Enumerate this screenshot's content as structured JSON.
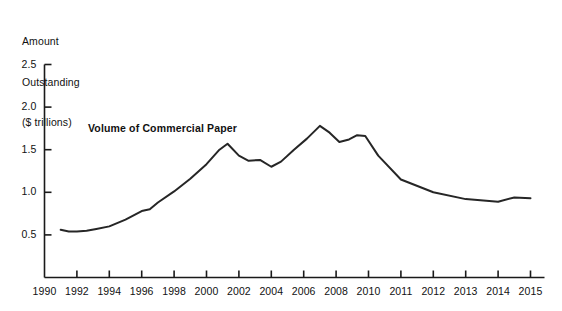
{
  "figure": {
    "background_color": "#ffffff",
    "axis_color": "#1a1a1a",
    "line_color": "#262626"
  },
  "axis_title": {
    "line1": "Amount",
    "line2": "Outstanding",
    "line3": "($ trillions)"
  },
  "annotation": {
    "text": "Volume of Commercial Paper",
    "x_px": 88,
    "y_px": 122
  },
  "chart_data": {
    "type": "line",
    "title": "",
    "subtitle": "",
    "xlabel": "",
    "ylabel": "Amount Outstanding ($ trillions)",
    "grid": false,
    "legend_position": "none",
    "annotations": [
      "Volume of Commercial Paper"
    ],
    "series_name": "Volume of Commercial Paper",
    "xlim": [
      1990,
      2015
    ],
    "ylim": [
      0,
      2.5
    ],
    "yticks": [
      0.5,
      1.0,
      1.5,
      2.0,
      2.5
    ],
    "ytick_labels": [
      "0.5",
      "1.0",
      "1.5",
      "2.0",
      "2.5"
    ],
    "xticks": [
      1990,
      1992,
      1994,
      1996,
      1998,
      2000,
      2002,
      2004,
      2006,
      2008,
      2010,
      2011,
      2012,
      2013,
      2014,
      2015
    ],
    "xtick_labels": [
      "1990",
      "1992",
      "1994",
      "1996",
      "1998",
      "2000",
      "2002",
      "2004",
      "2006",
      "2008",
      "2010",
      "2011",
      "2012",
      "2013",
      "2014",
      "2015"
    ],
    "x": [
      1991.0,
      1991.5,
      1992.0,
      1992.6,
      1993.2,
      1994.0,
      1995.0,
      1996.0,
      1996.5,
      1997.0,
      1998.0,
      1999.0,
      2000.0,
      2000.8,
      2001.3,
      2002.0,
      2002.6,
      2003.3,
      2004.0,
      2004.6,
      2005.4,
      2006.2,
      2007.0,
      2007.6,
      2008.2,
      2008.8,
      2009.3,
      2009.8,
      2010.3,
      2011.0,
      2012.0,
      2013.0,
      2014.0,
      2014.5,
      2015.0
    ],
    "values": [
      0.56,
      0.54,
      0.54,
      0.55,
      0.57,
      0.6,
      0.68,
      0.78,
      0.8,
      0.88,
      1.01,
      1.16,
      1.33,
      1.5,
      1.57,
      1.43,
      1.37,
      1.38,
      1.3,
      1.36,
      1.5,
      1.63,
      1.78,
      1.7,
      1.59,
      1.62,
      1.67,
      1.66,
      1.43,
      1.15,
      1.0,
      0.92,
      0.89,
      0.94,
      0.93
    ]
  }
}
